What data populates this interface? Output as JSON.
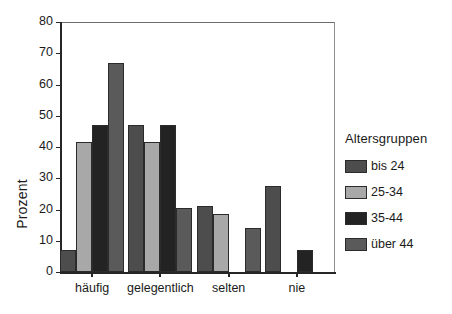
{
  "top_strip": {
    "clipped_text": ""
  },
  "chart_data": {
    "type": "bar",
    "title": "",
    "subtitle": "",
    "xlabel": "",
    "ylabel": "Prozent",
    "ylim": [
      0,
      80
    ],
    "ytick_step": 10,
    "yticks": [
      "0",
      "10",
      "20",
      "30",
      "40",
      "50",
      "60",
      "70",
      "80"
    ],
    "grid": false,
    "legend_position": "right",
    "legend_title": "Altersgruppen",
    "categories": [
      "häufig",
      "gelegentlich",
      "selten",
      "nie"
    ],
    "series": [
      {
        "name": "bis 24",
        "color": "#4d4d4d",
        "values": [
          7,
          47,
          21,
          27.5
        ]
      },
      {
        "name": "25-34",
        "color": "#a8a8a8",
        "values": [
          41.5,
          41.5,
          18.5,
          0
        ]
      },
      {
        "name": "35-44",
        "color": "#232323",
        "values": [
          47,
          47,
          0,
          7
        ]
      },
      {
        "name": "über 44",
        "color": "#5a5a5a",
        "values": [
          67,
          20.5,
          14,
          0
        ]
      }
    ]
  }
}
